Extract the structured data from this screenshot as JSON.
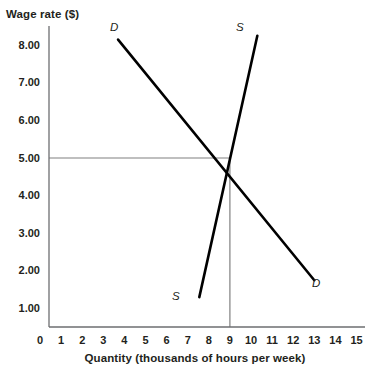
{
  "chart_data": {
    "type": "line",
    "title": "",
    "ylabel": "Wage rate ($)",
    "xlabel": "Quantity (thousands of hours per week)",
    "xlim": [
      0,
      15
    ],
    "ylim": [
      0,
      8.6
    ],
    "grid": false,
    "legend_position": "inline-endpoint-labels",
    "x_ticks": [
      "0",
      "1",
      "2",
      "3",
      "4",
      "5",
      "6",
      "7",
      "8",
      "9",
      "10",
      "11",
      "12",
      "13",
      "14",
      "15"
    ],
    "x_tick_values": [
      0,
      1,
      2,
      3,
      4,
      5,
      6,
      7,
      8,
      9,
      10,
      11,
      12,
      13,
      14,
      15
    ],
    "y_ticks": [
      "1.00",
      "2.00",
      "3.00",
      "4.00",
      "5.00",
      "6.00",
      "7.00",
      "8.00"
    ],
    "y_tick_values": [
      1,
      2,
      3,
      4,
      5,
      6,
      7,
      8
    ],
    "series": [
      {
        "name": "D",
        "label": "Demand",
        "color": "#000000",
        "label_start": "D",
        "label_end": "D",
        "points": [
          [
            3.7,
            8.15
          ],
          [
            13.0,
            1.75
          ]
        ]
      },
      {
        "name": "S",
        "label": "Supply",
        "color": "#000000",
        "label_start": "S",
        "label_end": "S",
        "points": [
          [
            7.55,
            1.3
          ],
          [
            10.3,
            8.25
          ]
        ]
      }
    ],
    "annotations": [
      {
        "name": "equilibrium",
        "x": 9,
        "y": 5.0,
        "guide_color": "#808080",
        "horizontal_guide": true,
        "vertical_guide": true
      }
    ]
  },
  "labels": {
    "demand_top": "D",
    "demand_bottom": "D",
    "supply_top": "S",
    "supply_bottom": "S"
  }
}
